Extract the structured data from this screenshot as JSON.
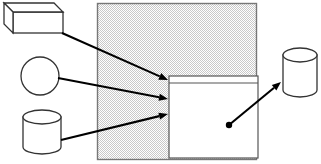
{
  "canvas": {
    "width": 321,
    "height": 164,
    "background": "#ffffff"
  },
  "palette": {
    "stroke": "#1a1a1a",
    "shape_outline": "#333333",
    "shape_fill": "#ffffff",
    "region_fill": "#e9e9e9",
    "region_outline": "#777777",
    "inner_panel_fill": "#ffffff",
    "inner_panel_outline": "#555555",
    "arrow": "#000000",
    "dot": "#000000"
  },
  "shapes": [
    {
      "id": "cuboid-top-left",
      "name": "cuboid-node",
      "type": "cuboid",
      "label": "",
      "x": 4,
      "y": 3,
      "width": 59,
      "height": 30,
      "depth": 9
    },
    {
      "id": "circle-left",
      "name": "circle-node",
      "type": "circle",
      "label": "",
      "cx": 40,
      "cy": 76,
      "r": 19
    },
    {
      "id": "cylinder-bottom-left",
      "name": "cylinder-node-left",
      "type": "cylinder",
      "label": "",
      "x": 23,
      "y": 110,
      "width": 38,
      "height": 44,
      "ellipse_ry": 7
    },
    {
      "id": "cylinder-right",
      "name": "cylinder-node-right",
      "type": "cylinder",
      "label": "",
      "x": 283,
      "y": 48,
      "width": 34,
      "height": 49,
      "ellipse_ry": 7
    }
  ],
  "regions": [
    {
      "id": "gray-region",
      "name": "shaded-region",
      "type": "rectangle",
      "label": "",
      "x": 97,
      "y": 3,
      "width": 160,
      "height": 157,
      "fill": "#e9e9e9"
    },
    {
      "id": "inner-panel",
      "name": "inner-panel",
      "type": "rectangle",
      "label": "",
      "x": 169,
      "y": 76,
      "width": 89,
      "height": 82,
      "fill": "#ffffff"
    },
    {
      "id": "inner-panel-header",
      "name": "inner-panel-header-band",
      "type": "rectangle",
      "label": "",
      "x": 169,
      "y": 76,
      "width": 89,
      "height": 7,
      "fill": "#ffffff"
    }
  ],
  "arrows": [
    {
      "id": "arrow-cuboid-to-panel",
      "name": "arrow-cuboid-to-panel",
      "from": "cuboid-top-left",
      "to": "inner-panel",
      "x1": 62,
      "y1": 33,
      "x2": 168,
      "y2": 80,
      "head": "arrowhead",
      "tail": "none"
    },
    {
      "id": "arrow-circle-to-panel",
      "name": "arrow-circle-to-panel",
      "from": "circle-left",
      "to": "inner-panel",
      "x1": 58,
      "y1": 78,
      "x2": 168,
      "y2": 99,
      "head": "arrowhead",
      "tail": "none"
    },
    {
      "id": "arrow-cylinder-to-panel",
      "name": "arrow-cylinder-to-panel",
      "from": "cylinder-bottom-left",
      "to": "inner-panel",
      "x1": 61,
      "y1": 140,
      "x2": 168,
      "y2": 114,
      "head": "arrowhead",
      "tail": "none"
    },
    {
      "id": "arrow-panel-to-cylinder-right",
      "name": "arrow-panel-to-cylinder-right",
      "from": "inner-panel",
      "to": "cylinder-right",
      "x1": 229,
      "y1": 125,
      "x2": 281,
      "y2": 82,
      "head": "arrowhead",
      "tail": "dot",
      "dot_radius": 3.2
    }
  ]
}
